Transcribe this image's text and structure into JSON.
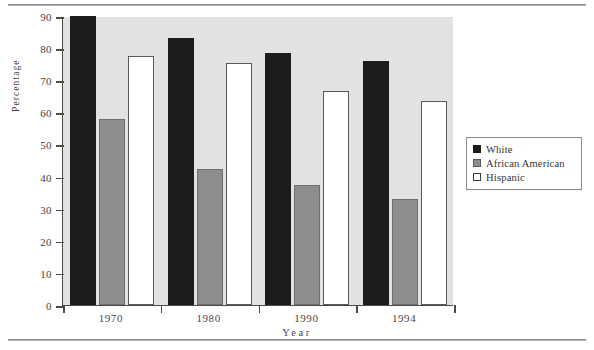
{
  "chart_data": {
    "type": "bar",
    "title": "",
    "xlabel": "Year",
    "ylabel": "Percentage",
    "categories": [
      "1970",
      "1980",
      "1990",
      "1994"
    ],
    "series": [
      {
        "name": "White",
        "color": "#1c1c1c",
        "values": [
          90,
          83,
          78.5,
          76
        ]
      },
      {
        "name": "African  American",
        "color": "#8d8d8d",
        "values": [
          58,
          42.5,
          37.5,
          33
        ]
      },
      {
        "name": "Hispanic",
        "color": "#ffffff",
        "values": [
          77.5,
          75.5,
          66.5,
          63.5
        ]
      }
    ],
    "ylim": [
      0,
      90
    ],
    "ytick_values": [
      0,
      10,
      20,
      30,
      40,
      50,
      60,
      70,
      80,
      90
    ],
    "ytick_labels": [
      "0",
      "10",
      "20",
      "30",
      "40",
      "50",
      "60",
      "70",
      "80",
      "90"
    ],
    "grid": false,
    "legend_position": "right",
    "plot_background": "#e2e2e2",
    "axis_color": "#4a4a4a"
  },
  "legend": {
    "items": [
      {
        "label": "White"
      },
      {
        "label": "African   American"
      },
      {
        "label": "Hispanic"
      }
    ]
  }
}
